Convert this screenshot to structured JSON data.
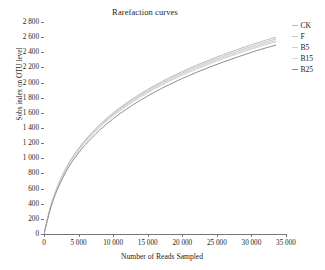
{
  "chart_data": {
    "type": "line",
    "title": "Rarefaction curves",
    "xlabel": "Number of Reads Sampled",
    "ylabel": "Sobs index on OTU level",
    "xlim": [
      0,
      35000
    ],
    "ylim": [
      0,
      2800
    ],
    "grid": false,
    "legend_position": "right",
    "x_ticks": [
      "0",
      "5 000",
      "10 000",
      "15 000",
      "20 000",
      "25 000",
      "30 000",
      "35 000"
    ],
    "x_tick_values": [
      0,
      5000,
      10000,
      15000,
      20000,
      25000,
      30000,
      35000
    ],
    "y_ticks": [
      "0",
      "200",
      "400",
      "600",
      "800",
      "1 000",
      "1 200",
      "1 400",
      "1 600",
      "1 800",
      "2 000",
      "2 200",
      "2 400",
      "2 600",
      "2 800"
    ],
    "y_tick_values": [
      0,
      200,
      400,
      600,
      800,
      1000,
      1200,
      1400,
      1600,
      1800,
      2000,
      2200,
      2400,
      2600,
      2800
    ],
    "x": [
      0,
      500,
      1000,
      1500,
      2000,
      3000,
      4000,
      5000,
      6000,
      8000,
      10000,
      12000,
      14000,
      16000,
      18000,
      20000,
      22000,
      24000,
      26000,
      28000,
      30000,
      32000,
      33500
    ],
    "series": [
      {
        "name": "CK",
        "color": "#b9b9b9",
        "values": [
          0,
          200,
          380,
          520,
          640,
          840,
          1000,
          1130,
          1245,
          1440,
          1600,
          1735,
          1855,
          1962,
          2058,
          2146,
          2228,
          2302,
          2372,
          2438,
          2500,
          2558,
          2598
        ]
      },
      {
        "name": "F",
        "color": "#c6c6c6",
        "values": [
          0,
          198,
          376,
          515,
          633,
          832,
          990,
          1118,
          1232,
          1425,
          1584,
          1718,
          1837,
          1943,
          2039,
          2126,
          2207,
          2281,
          2350,
          2415,
          2477,
          2534,
          2574
        ]
      },
      {
        "name": "B5",
        "color": "#cfcfcf",
        "values": [
          0,
          196,
          372,
          510,
          627,
          824,
          981,
          1108,
          1221,
          1412,
          1570,
          1703,
          1821,
          1926,
          2021,
          2108,
          2188,
          2262,
          2330,
          2395,
          2456,
          2513,
          2552
        ]
      },
      {
        "name": "B15",
        "color": "#d6d6d6",
        "values": [
          0,
          195,
          370,
          507,
          623,
          819,
          975,
          1101,
          1214,
          1404,
          1561,
          1693,
          1810,
          1915,
          2010,
          2096,
          2175,
          2248,
          2317,
          2381,
          2442,
          2498,
          2537
        ]
      },
      {
        "name": "B25",
        "color": "#8d8d8d",
        "values": [
          0,
          186,
          356,
          489,
          602,
          793,
          946,
          1070,
          1181,
          1368,
          1523,
          1654,
          1770,
          1874,
          1968,
          2054,
          2133,
          2206,
          2274,
          2338,
          2399,
          2455,
          2494
        ]
      }
    ]
  },
  "legend": {
    "entries": [
      {
        "label": "CK"
      },
      {
        "label": "F"
      },
      {
        "label": "B5"
      },
      {
        "label": "B15"
      },
      {
        "label": "B25"
      }
    ]
  },
  "colors": {
    "axis": "#767676",
    "text": "#1c1c1c",
    "background": "#ffffff"
  }
}
